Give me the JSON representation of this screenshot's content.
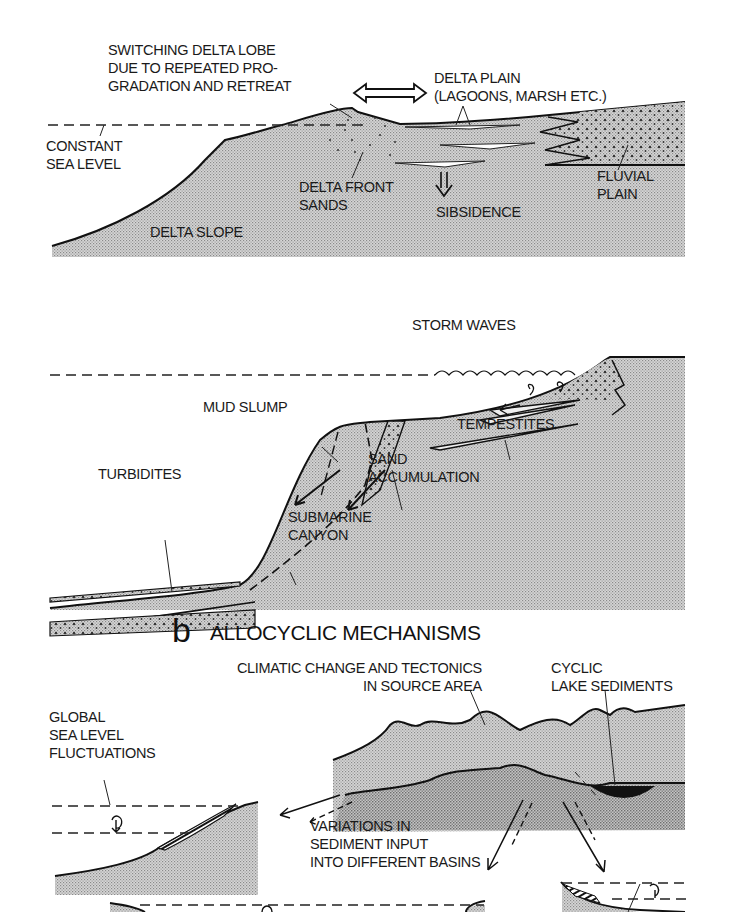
{
  "colors": {
    "background": "#ffffff",
    "stipple_fill": "#c8c8c8",
    "stipple_dark": "#b4b4b4",
    "line": "#111111"
  },
  "panel_a1": {
    "name": "delta-lobe-switching",
    "labels": {
      "switching_lobe": "SWITCHING DELTA LOBE\nDUE TO REPEATED PRO-\nGRADATION AND RETREAT",
      "delta_plain": "DELTA PLAIN\n(LAGOONS, MARSH ETC.)",
      "constant_sea_level": "CONSTANT\nSEA LEVEL",
      "delta_front_sands": "DELTA FRONT\nSANDS",
      "subsidence": "SIBSIDENCE",
      "fluvial_plain": "FLUVIAL\nPLAIN",
      "delta_slope": "DELTA SLOPE"
    },
    "icons": [
      "double-headed-arrow-icon",
      "subsidence-down-arrow-icon"
    ]
  },
  "panel_a2": {
    "name": "shelf-slope-processes",
    "labels": {
      "storm_waves": "STORM WAVES",
      "mud_slump": "MUD SLUMP",
      "tempestites": "TEMPESTITES",
      "turbidites": "TURBIDITES",
      "sand_accumulation": "SAND\nACCUMULATION",
      "submarine_canyon": "SUBMARINE\nCANYON"
    }
  },
  "panel_b": {
    "letter": "b",
    "title": "ALLOCYCLIC MECHANISMS",
    "labels": {
      "climatic_change": "CLIMATIC CHANGE AND TECTONICS\nIN SOURCE AREA",
      "cyclic_lake": "CYCLIC\nLAKE SEDIMENTS",
      "global_sea_level": "GLOBAL\nSEA LEVEL\nFLUCTUATIONS",
      "variations_input": "VARIATIONS IN\nSEDIMENT INPUT\nINTO DIFFERENT BASINS"
    }
  }
}
